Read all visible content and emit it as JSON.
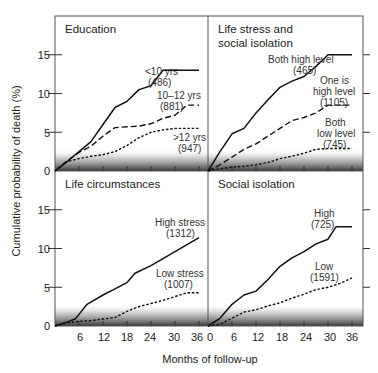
{
  "chart_data": [
    {
      "type": "line",
      "title": "Education",
      "xlabel": "Months of follow-up",
      "ylabel": "Cumulative probability of death (%)",
      "xlim": [
        0,
        36
      ],
      "ylim": [
        0,
        18
      ],
      "xticks": [
        0,
        6,
        12,
        18,
        24,
        30,
        36
      ],
      "yticks": [
        0,
        5,
        10,
        15
      ],
      "series": [
        {
          "name": "<10 yrs",
          "n": "(486)",
          "style": "solid",
          "x": [
            0,
            3,
            6,
            9,
            12,
            15,
            18,
            21,
            24,
            27,
            30,
            33,
            36
          ],
          "y": [
            0,
            1.2,
            2.5,
            3.8,
            6.0,
            8.2,
            9.0,
            10.5,
            11.0,
            13.0,
            13.0,
            13.0,
            13.0
          ]
        },
        {
          "name": "10–12 yrs",
          "n": "(881)",
          "style": "dashed",
          "x": [
            0,
            3,
            6,
            9,
            12,
            15,
            18,
            21,
            24,
            27,
            30,
            33,
            36
          ],
          "y": [
            0,
            1.3,
            2.4,
            3.2,
            4.5,
            5.6,
            5.7,
            5.8,
            6.1,
            6.8,
            7.2,
            8.5,
            8.5
          ]
        },
        {
          "name": ">12 yrs",
          "n": "(947)",
          "style": "dotted",
          "x": [
            0,
            3,
            6,
            9,
            12,
            15,
            18,
            21,
            24,
            27,
            30,
            33,
            36
          ],
          "y": [
            0,
            1.2,
            1.6,
            1.9,
            2.1,
            2.5,
            3.3,
            4.3,
            5.0,
            5.3,
            5.5,
            5.5,
            5.5
          ]
        }
      ]
    },
    {
      "type": "line",
      "title": "Life stress and social isolation",
      "title_lines": [
        "Life stress and",
        "social isolation"
      ],
      "xlim": [
        0,
        36
      ],
      "ylim": [
        0,
        18
      ],
      "xticks": [
        0,
        6,
        12,
        18,
        24,
        30,
        36
      ],
      "yticks": [
        0,
        5,
        10,
        15
      ],
      "series": [
        {
          "name": "Both high level",
          "n": "(465)",
          "style": "solid",
          "x": [
            0,
            3,
            6,
            9,
            12,
            15,
            18,
            21,
            24,
            27,
            30,
            33,
            36
          ],
          "y": [
            0,
            2.5,
            4.8,
            5.5,
            7.5,
            9.2,
            10.8,
            11.6,
            12.2,
            13.5,
            15.0,
            15.0,
            15.0
          ]
        },
        {
          "name": "One is high level",
          "name_lines": [
            "One is",
            "high level"
          ],
          "n": "(1105)",
          "style": "dashed",
          "x": [
            0,
            3,
            6,
            9,
            12,
            15,
            18,
            21,
            24,
            27,
            30,
            33,
            36
          ],
          "y": [
            0,
            0.8,
            1.8,
            2.8,
            3.5,
            4.5,
            5.5,
            6.5,
            6.9,
            7.5,
            8.5,
            8.5,
            8.5
          ]
        },
        {
          "name": "Both low level",
          "name_lines": [
            "Both",
            "low level"
          ],
          "n": "(745)",
          "style": "dotted",
          "x": [
            0,
            3,
            6,
            9,
            12,
            15,
            18,
            21,
            24,
            27,
            30,
            33,
            36
          ],
          "y": [
            0,
            0.3,
            0.5,
            0.6,
            0.8,
            1.1,
            1.6,
            1.9,
            2.3,
            2.8,
            2.9,
            2.9,
            2.9
          ]
        }
      ]
    },
    {
      "type": "line",
      "title": "Life circumstances",
      "xlim": [
        0,
        36
      ],
      "ylim": [
        0,
        18
      ],
      "xticks": [
        0,
        6,
        12,
        18,
        24,
        30,
        36
      ],
      "yticks": [
        0,
        5,
        10,
        15
      ],
      "series": [
        {
          "name": "High stress",
          "n": "(1312)",
          "style": "solid",
          "x": [
            0,
            3,
            5,
            6,
            8,
            12,
            15,
            18,
            20,
            24,
            27,
            30,
            33,
            36
          ],
          "y": [
            0,
            0.5,
            0.9,
            1.5,
            2.8,
            4.0,
            4.8,
            5.6,
            6.8,
            7.8,
            8.7,
            9.6,
            10.5,
            11.4
          ]
        },
        {
          "name": "Low stress",
          "n": "(1007)",
          "style": "dotted",
          "x": [
            0,
            3,
            6,
            9,
            12,
            15,
            18,
            21,
            24,
            27,
            30,
            33,
            36
          ],
          "y": [
            0,
            0.4,
            0.6,
            0.7,
            0.9,
            1.1,
            1.9,
            2.5,
            2.9,
            3.3,
            3.8,
            4.3,
            4.3
          ]
        }
      ]
    },
    {
      "type": "line",
      "title": "Social isolation",
      "xlim": [
        0,
        36
      ],
      "ylim": [
        0,
        18
      ],
      "xticks": [
        0,
        6,
        12,
        18,
        24,
        30,
        36
      ],
      "yticks": [
        0,
        5,
        10,
        15
      ],
      "series": [
        {
          "name": "High",
          "n": "(725)",
          "style": "solid",
          "x": [
            0,
            3,
            6,
            9,
            12,
            15,
            18,
            21,
            24,
            27,
            30,
            32,
            36
          ],
          "y": [
            0,
            1.0,
            2.8,
            4.0,
            4.5,
            6.0,
            7.7,
            8.8,
            9.6,
            10.6,
            11.2,
            12.8,
            12.8
          ]
        },
        {
          "name": "Low",
          "n": "(1591)",
          "style": "dotted",
          "x": [
            0,
            3,
            6,
            9,
            12,
            15,
            18,
            21,
            24,
            27,
            30,
            33,
            36
          ],
          "y": [
            0,
            0.2,
            1.0,
            1.8,
            2.1,
            2.6,
            3.0,
            3.6,
            4.1,
            4.7,
            5.0,
            5.5,
            6.2
          ]
        }
      ]
    }
  ],
  "axes": {
    "ylabel": "Cumulative probability of death (%)",
    "xlabel": "Months of follow-up",
    "bottom_tick_labels_left": [
      "6",
      "12",
      "18",
      "24",
      "30",
      "36"
    ],
    "bottom_tick_labels_right": [
      "0",
      "6",
      "12",
      "18",
      "24",
      "30",
      "36"
    ],
    "ytick_labels": [
      "0",
      "5",
      "10",
      "15"
    ]
  },
  "panels": {
    "top_left": {
      "title": "Education",
      "labels": [
        {
          "text": "<10 yrs",
          "x": 145,
          "y": 75
        },
        {
          "text": "(486)",
          "x": 148,
          "y": 86
        },
        {
          "text": "10–12 yrs",
          "x": 157,
          "y": 99
        },
        {
          "text": "(881)",
          "x": 160,
          "y": 110
        },
        {
          "text": ">12 yrs",
          "x": 173,
          "y": 141
        },
        {
          "text": "(947)",
          "x": 178,
          "y": 152
        }
      ]
    },
    "top_right": {
      "title_line1": "Life stress and",
      "title_line2": "social isolation",
      "labels": [
        {
          "text": "Both high level",
          "x": 268,
          "y": 63
        },
        {
          "text": "(465)",
          "x": 293,
          "y": 74
        },
        {
          "text": "One is",
          "x": 320,
          "y": 84
        },
        {
          "text": "high level",
          "x": 313,
          "y": 95
        },
        {
          "text": "(1105)",
          "x": 320,
          "y": 106
        },
        {
          "text": "Both",
          "x": 325,
          "y": 126
        },
        {
          "text": "low level",
          "x": 317,
          "y": 137
        },
        {
          "text": "(745)",
          "x": 323,
          "y": 148
        }
      ]
    },
    "bottom_left": {
      "title": "Life circumstances",
      "labels": [
        {
          "text": "High stress",
          "x": 155,
          "y": 226
        },
        {
          "text": "(1312)",
          "x": 166,
          "y": 237
        },
        {
          "text": "Low stress",
          "x": 156,
          "y": 277
        },
        {
          "text": "(1007)",
          "x": 164,
          "y": 288
        }
      ]
    },
    "bottom_right": {
      "title": "Social isolation",
      "labels": [
        {
          "text": "High",
          "x": 314,
          "y": 217
        },
        {
          "text": "(725)",
          "x": 311,
          "y": 228
        },
        {
          "text": "Low",
          "x": 315,
          "y": 270
        },
        {
          "text": "(1591)",
          "x": 310,
          "y": 281
        }
      ]
    }
  }
}
